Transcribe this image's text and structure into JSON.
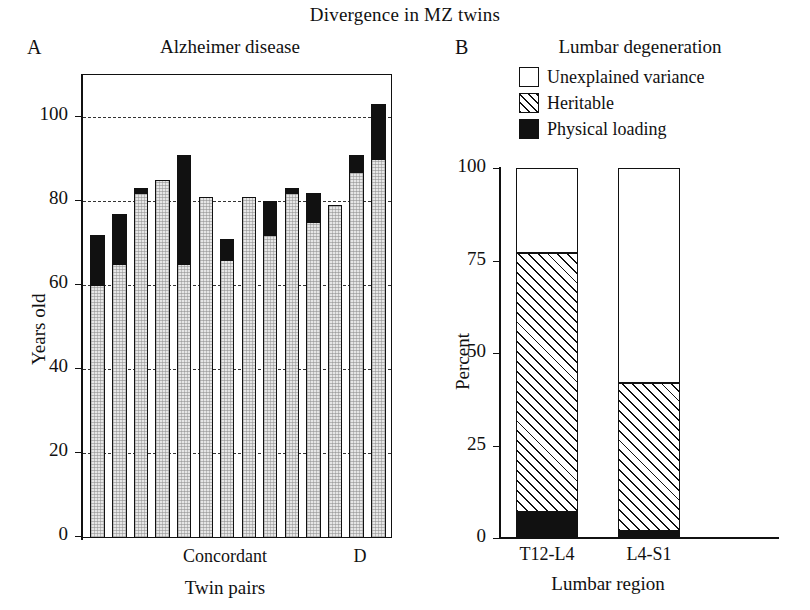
{
  "figure": {
    "main_title": "Divergence in MZ twins"
  },
  "panel_a": {
    "letter": "A",
    "title": "Alzheimer disease",
    "ylabel": "Years old",
    "xlabel": "Twin pairs",
    "ytick_labels": [
      "0",
      "20",
      "40",
      "60",
      "80",
      "100"
    ],
    "xtick_labels": [
      "Concordant",
      "D"
    ]
  },
  "panel_b": {
    "letter": "B",
    "title": "Lumbar degeneration",
    "ylabel": "Percent",
    "xlabel": "Lumbar region",
    "ytick_labels": [
      "0",
      "25",
      "50",
      "75",
      "100"
    ],
    "xtick_labels": [
      "T12-L4",
      "L4-S1"
    ],
    "legend": [
      {
        "label": "Unexplained variance",
        "swatch": "white-square-icon"
      },
      {
        "label": "Heritable",
        "swatch": "hatched-square-icon"
      },
      {
        "label": "Physical loading",
        "swatch": "black-square-icon"
      }
    ]
  },
  "chart_data": [
    {
      "type": "bar",
      "title": "Alzheimer disease",
      "panel": "A",
      "xlabel": "Twin pairs",
      "ylabel": "Years old",
      "ylim": [
        0,
        110
      ],
      "yticks": [
        0,
        20,
        40,
        60,
        80,
        100
      ],
      "gridlines": [
        20,
        40,
        60,
        80,
        100
      ],
      "grid": true,
      "legend_position": "none",
      "xtick_labels": [
        "Concordant",
        "D"
      ],
      "note": "Paired bars: each twin pair has two bars. Grey segment = age at onset (first value); black segment top = age at last follow-up / second event.",
      "series": [
        {
          "name": "Age at onset (grey)",
          "values": [
            60,
            65,
            82,
            85,
            65,
            81,
            66,
            81,
            72,
            82,
            75,
            79,
            87,
            90
          ]
        },
        {
          "name": "Upper extent (black top)",
          "values": [
            72,
            77,
            83,
            85,
            91,
            81,
            71,
            81,
            80,
            83,
            82,
            79,
            91,
            103
          ]
        }
      ],
      "pairs": [
        {
          "pair": 1,
          "group": "Concordant",
          "twin1_grey": 60,
          "twin1_top": 72,
          "twin2_grey": 65,
          "twin2_top": 77
        },
        {
          "pair": 2,
          "group": "Concordant",
          "twin1_grey": 82,
          "twin1_top": 83,
          "twin2_grey": 85,
          "twin2_top": 85
        },
        {
          "pair": 3,
          "group": "Concordant",
          "twin1_grey": 65,
          "twin1_top": 91,
          "twin2_grey": 81,
          "twin2_top": 81
        },
        {
          "pair": 4,
          "group": "Concordant",
          "twin1_grey": 66,
          "twin1_top": 71,
          "twin2_grey": 81,
          "twin2_top": 81
        },
        {
          "pair": 5,
          "group": "Concordant",
          "twin1_grey": 72,
          "twin1_top": 80,
          "twin2_grey": 82,
          "twin2_top": 83
        },
        {
          "pair": 6,
          "group": "Concordant",
          "twin1_grey": 75,
          "twin1_top": 82,
          "twin2_grey": 79,
          "twin2_top": 79
        },
        {
          "pair": 7,
          "group": "D",
          "twin1_grey": 87,
          "twin1_top": 91,
          "twin2_grey": 90,
          "twin2_top": 103
        }
      ]
    },
    {
      "type": "bar",
      "subtype": "stacked",
      "title": "Lumbar degeneration",
      "panel": "B",
      "xlabel": "Lumbar region",
      "ylabel": "Percent",
      "ylim": [
        0,
        100
      ],
      "yticks": [
        0,
        25,
        50,
        75,
        100
      ],
      "grid": false,
      "legend_position": "top-right",
      "categories": [
        "T12-L4",
        "L4-S1"
      ],
      "series": [
        {
          "name": "Physical loading",
          "values": [
            7,
            2
          ]
        },
        {
          "name": "Heritable",
          "values": [
            70,
            40
          ]
        },
        {
          "name": "Unexplained variance",
          "values": [
            23,
            58
          ]
        }
      ],
      "cumulative_tops": {
        "T12-L4": {
          "physical_loading": 7,
          "heritable": 77,
          "unexplained": 100
        },
        "L4-S1": {
          "physical_loading": 2,
          "heritable": 42,
          "unexplained": 100
        }
      }
    }
  ]
}
